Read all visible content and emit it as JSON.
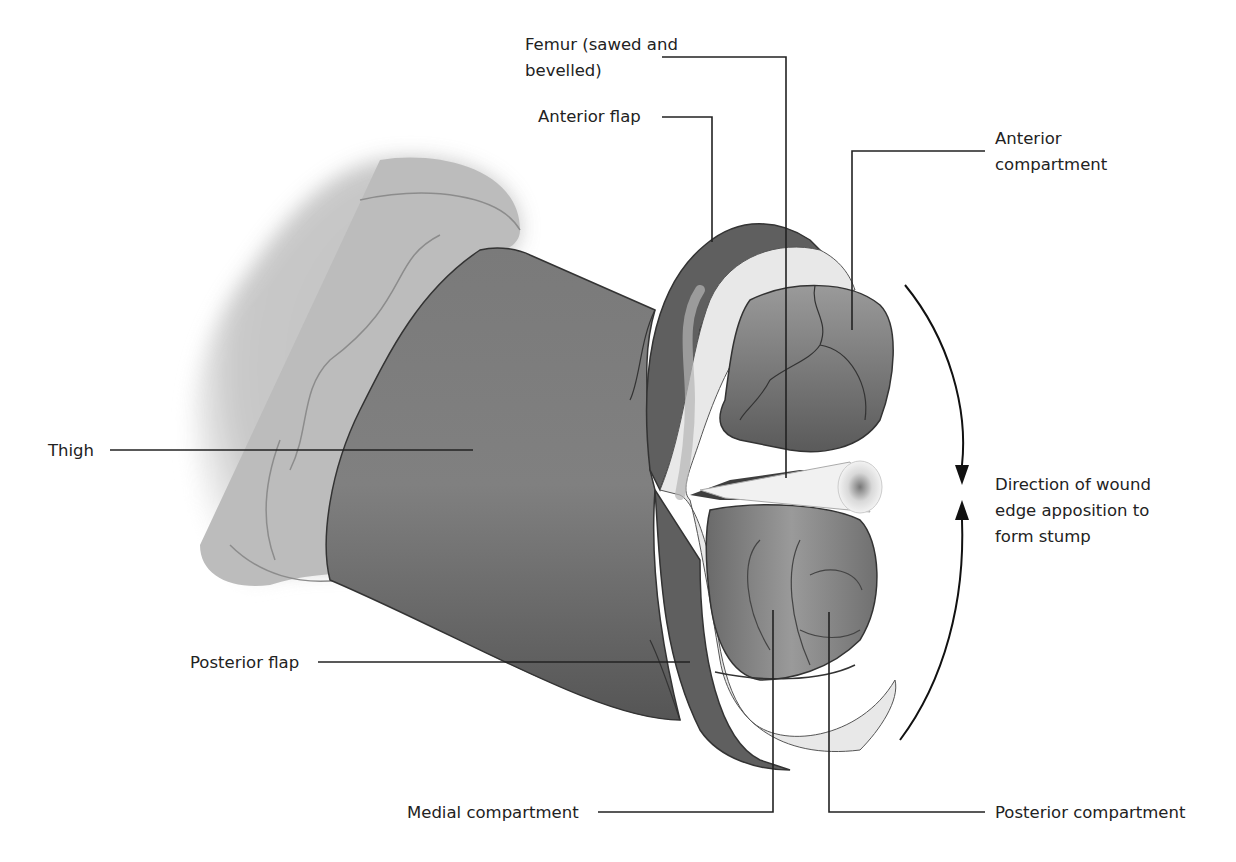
{
  "diagram": {
    "labels": {
      "femur_line1": "Femur (sawed and",
      "femur_line2": "bevelled)",
      "anterior_flap": "Anterior flap",
      "anterior_compartment_line1": "Anterior",
      "anterior_compartment_line2": "compartment",
      "thigh": "Thigh",
      "direction_line1": "Direction of wound",
      "direction_line2": "edge apposition to",
      "direction_line3": "form stump",
      "posterior_flap": "Posterior flap",
      "medial_compartment": "Medial compartment",
      "posterior_compartment": "Posterior compartment"
    },
    "colors": {
      "background": "#ffffff",
      "skin_dark": "#6e6e6e",
      "skin_light": "#bdbdbd",
      "fat_layer": "#e6e6e6",
      "muscle": "#8a8a8a",
      "bone": "#f2f2f2",
      "leader_line": "#222222"
    }
  }
}
